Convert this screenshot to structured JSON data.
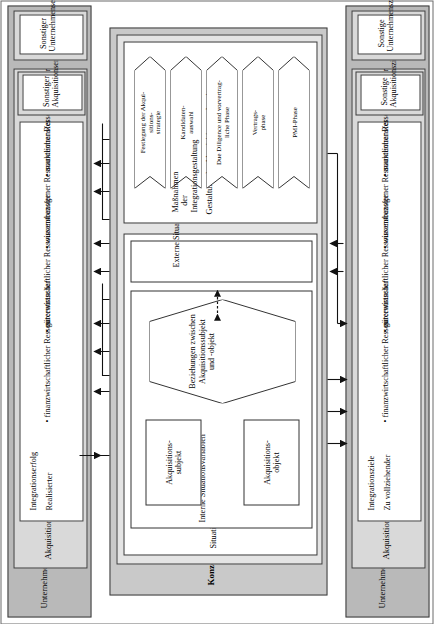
{
  "figure": {
    "title": "Konzeptioneller Bezugsrahmen des Erfolgsfaktorenmodells"
  },
  "top_band": {
    "band_label": "Unternehmenserfolg",
    "group_label": "Akquisitionserfolg",
    "content": {
      "heading": "Integrationserfolg",
      "subheading": "Realisierter",
      "bullets": [
        "finanzwirtschaftlicher Ressourcentransfer",
        "güterwirtschaftlicher Ressourcentransfer",
        "wissensbezogener Ressourcentransfer",
        "marktlicher Ressourcentransfer"
      ]
    },
    "other_group": "Sonstiger Akquisitionserfolg",
    "other_band": "Sonstiger Unternehmenserfolg"
  },
  "bottom_band": {
    "band_label": "Unternehmensziele",
    "group_label": "Akquisitionsziele",
    "content": {
      "heading": "Integrationsziele",
      "subheading": "Zu vollziehender",
      "bullets": [
        "finanzwirtschaftlicher Ressourcentransfer",
        "güterwirtschaftlicher Ressourcentransfer",
        "wissensbezogener Ressourcentransfer",
        "marktlicher Ressourcentransfer"
      ]
    },
    "other_group": "Sonstige Akquisitionsziele",
    "other_band": "Sonstige Unternehmensziele"
  },
  "center": {
    "situation_label": "Situationsvariablen",
    "internal_label": "Interne Situationsvariablen",
    "external_label": "Externe Situationsvariablen",
    "acq_subject": "Akquisitions-\nsubjekt",
    "acq_object": "Akquisitions-\nobjekt",
    "relation": "Beziehungen zwischen Akquisitionssubjekt und -objekt",
    "design_label": "Gestaltung der Akquisitionsvorbereitung",
    "integration_label": "Maßnahmen der Integrationsgestaltung",
    "phases": [
      "Festlegung der Akqui-\nsitions-\nstrategie",
      "Kandidaten-\nauswahl",
      "Due Diligence und vorvertrag-\nliche Phase",
      "Vertrags-\nphase",
      "PMI-Phase"
    ]
  },
  "colors": {
    "band_outer": "#b9b9b9",
    "band_inner": "#d9d9d9",
    "center_outer": "#c9c9c9",
    "center_inner": "#e4e4e4",
    "line": "#333333"
  }
}
